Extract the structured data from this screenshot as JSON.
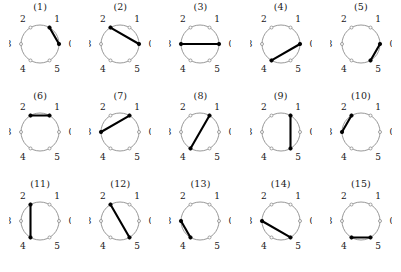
{
  "figure": {
    "title": "",
    "vertex_labels": [
      "0",
      "1",
      "2",
      "3",
      "4",
      "5"
    ],
    "vertex_count": 6,
    "colors": {
      "circle_stroke": "#8c8c8c",
      "chord_stroke": "#000000",
      "vertex_open_fill": "#ffffff",
      "vertex_filled_fill": "#000000",
      "text": "#1a1a1a",
      "background": "#ffffff"
    },
    "layout": {
      "rows": 3,
      "columns": 5
    },
    "diagrams": [
      {
        "caption": "(1)",
        "chord": [
          1,
          0
        ],
        "highlighted": [
          "0",
          "1"
        ]
      },
      {
        "caption": "(2)",
        "chord": [
          2,
          0
        ],
        "highlighted": [
          "0",
          "2"
        ]
      },
      {
        "caption": "(3)",
        "chord": [
          3,
          0
        ],
        "highlighted": [
          "0",
          "3"
        ]
      },
      {
        "caption": "(4)",
        "chord": [
          4,
          0
        ],
        "highlighted": [
          "0",
          "4"
        ]
      },
      {
        "caption": "(5)",
        "chord": [
          5,
          0
        ],
        "highlighted": [
          "0",
          "5"
        ]
      },
      {
        "caption": "(6)",
        "chord": [
          2,
          1
        ],
        "highlighted": [
          "1",
          "2"
        ]
      },
      {
        "caption": "(7)",
        "chord": [
          3,
          1
        ],
        "highlighted": [
          "1",
          "3"
        ]
      },
      {
        "caption": "(8)",
        "chord": [
          4,
          1
        ],
        "highlighted": [
          "1",
          "4"
        ]
      },
      {
        "caption": "(9)",
        "chord": [
          5,
          1
        ],
        "highlighted": [
          "1",
          "5"
        ]
      },
      {
        "caption": "(10)",
        "chord": [
          3,
          2
        ],
        "highlighted": [
          "2",
          "3"
        ]
      },
      {
        "caption": "(11)",
        "chord": [
          4,
          2
        ],
        "highlighted": [
          "2",
          "4"
        ]
      },
      {
        "caption": "(12)",
        "chord": [
          5,
          2
        ],
        "highlighted": [
          "2",
          "5"
        ]
      },
      {
        "caption": "(13)",
        "chord": [
          4,
          3
        ],
        "highlighted": [
          "3",
          "4"
        ]
      },
      {
        "caption": "(14)",
        "chord": [
          5,
          3
        ],
        "highlighted": [
          "3",
          "5"
        ]
      },
      {
        "caption": "(15)",
        "chord": [
          5,
          4
        ],
        "highlighted": [
          "4",
          "5"
        ]
      }
    ]
  }
}
